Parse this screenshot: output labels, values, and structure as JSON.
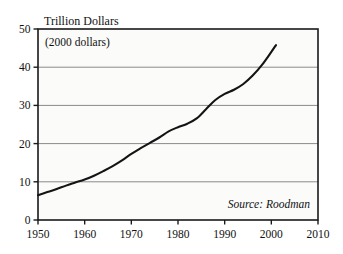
{
  "chart_data": {
    "type": "line",
    "title": "Trillion Dollars",
    "subtitle": "(2000 dollars)",
    "source_note": "Source: Roodman",
    "xlabel": "",
    "ylabel": "",
    "xlim": [
      1950,
      2010
    ],
    "ylim": [
      0,
      50
    ],
    "xticks": [
      1950,
      1960,
      1970,
      1980,
      1990,
      2000,
      2010
    ],
    "yticks": [
      0,
      10,
      20,
      30,
      40,
      50
    ],
    "xtick_labels": [
      "1950",
      "1960",
      "1970",
      "1980",
      "1990",
      "2000",
      "2010"
    ],
    "ytick_labels": [
      "0",
      "10",
      "20",
      "30",
      "40",
      "50"
    ],
    "grid": "horizontal",
    "gridlines_at": [
      10,
      20,
      30,
      40
    ],
    "legend": "none",
    "line_color": "#141414",
    "grid_color": "#8a8a8a",
    "frame_color": "#1a1a1a",
    "background_color": "#fbfbfa",
    "series": [
      {
        "name": "Gross World Product",
        "x": [
          1950,
          1952,
          1954,
          1956,
          1958,
          1960,
          1962,
          1964,
          1966,
          1968,
          1970,
          1972,
          1974,
          1976,
          1978,
          1980,
          1982,
          1984,
          1986,
          1988,
          1990,
          1992,
          1994,
          1996,
          1998,
          2000,
          2001
        ],
        "values": [
          6.5,
          7.3,
          8.1,
          9.0,
          9.8,
          10.6,
          11.6,
          12.8,
          14.1,
          15.6,
          17.3,
          18.8,
          20.2,
          21.6,
          23.2,
          24.3,
          25.2,
          26.6,
          29.0,
          31.4,
          33.0,
          34.1,
          35.6,
          37.8,
          40.6,
          44.0,
          45.8
        ]
      }
    ]
  },
  "figure": {
    "plot_left": 38,
    "plot_top": 29,
    "plot_right": 318,
    "plot_bottom": 220
  }
}
